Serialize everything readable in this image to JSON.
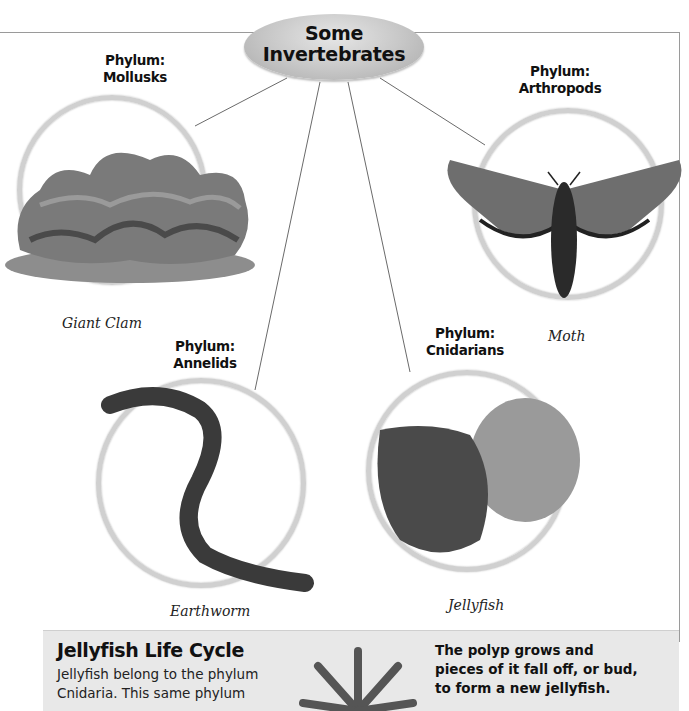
{
  "title": {
    "line1": "Some",
    "line2": "Invertebrates"
  },
  "groups": [
    {
      "phylum_label": "Phylum:",
      "phylum_name": "Mollusks",
      "caption": "Giant Clam",
      "icon": "giant-clam-image"
    },
    {
      "phylum_label": "Phylum:",
      "phylum_name": "Arthropods",
      "caption": "Moth",
      "icon": "moth-image"
    },
    {
      "phylum_label": "Phylum:",
      "phylum_name": "Annelids",
      "caption": "Earthworm",
      "icon": "earthworm-image"
    },
    {
      "phylum_label": "Phylum:",
      "phylum_name": "Cnidarians",
      "caption": "Jellyfish",
      "icon": "jellyfish-image"
    }
  ],
  "panel": {
    "title": "Jellyfish Life Cycle",
    "text_lines": [
      "Jellyfish belong to the phylum",
      "Cnidaria. This same phylum"
    ],
    "side_lines": [
      "The polyp grows and",
      "pieces of it fall off, or bud,",
      "to form a new jellyfish."
    ],
    "icon": "polyp-image"
  },
  "colors": {
    "ring": "#d0d0d0",
    "oval": "#c6c6c6",
    "panel_bg": "#e8e8e8",
    "line": "#6a6a6a"
  }
}
